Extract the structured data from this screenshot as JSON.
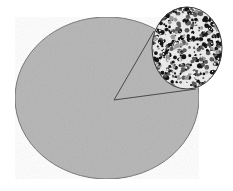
{
  "diagram": {
    "type": "magnified-inset",
    "colors": {
      "background": "#ffffff",
      "ellipse_fill": "#b4b4b4",
      "ellipse_stroke": "#6e6e6e",
      "inset_base": "#e8e8e8",
      "pore_dark": "#141414",
      "pore_mid": "#5a5a5a",
      "line": "#4a4a4a"
    },
    "ellipse": {
      "cx": 107,
      "cy": 98,
      "rx": 92,
      "ry": 81
    },
    "inset": {
      "cx": 187,
      "cy": 48,
      "rx": 35,
      "ry": 41
    },
    "apex": {
      "x": 114,
      "y": 100
    },
    "connector_ends": [
      {
        "x": 154,
        "y": 31
      },
      {
        "x": 196,
        "y": 89
      }
    ]
  }
}
